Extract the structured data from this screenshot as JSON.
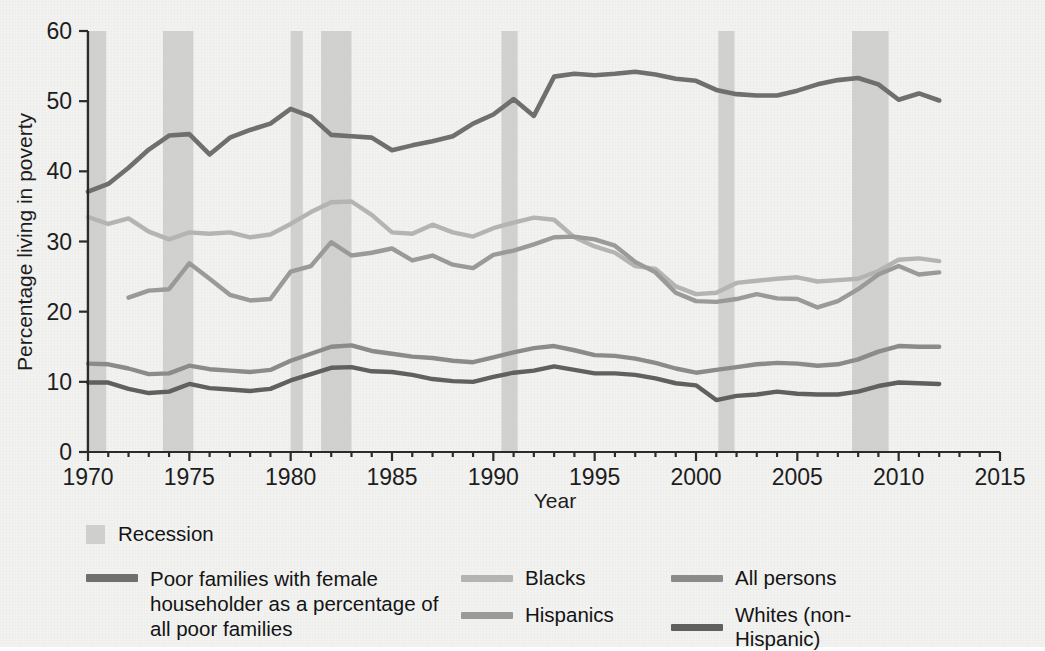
{
  "chart_data": {
    "type": "line",
    "title": "",
    "xlabel": "Year",
    "ylabel": "Percentage living in poverty",
    "xlim": [
      1970,
      2015
    ],
    "ylim": [
      0,
      60
    ],
    "xticks": [
      1970,
      1975,
      1980,
      1985,
      1990,
      1995,
      2000,
      2005,
      2010,
      2015
    ],
    "yticks": [
      0,
      10,
      20,
      30,
      40,
      50,
      60
    ],
    "grid": false,
    "legend_position": "below-plot",
    "recession_label": "Recession",
    "recessions": [
      {
        "start": 1969.9,
        "end": 1970.9
      },
      {
        "start": 1973.7,
        "end": 1975.2
      },
      {
        "start": 1980.0,
        "end": 1980.6
      },
      {
        "start": 1981.5,
        "end": 1983.0
      },
      {
        "start": 1990.4,
        "end": 1991.2
      },
      {
        "start": 2001.1,
        "end": 2001.9
      },
      {
        "start": 2007.7,
        "end": 2009.5
      }
    ],
    "series": [
      {
        "name": "Poor families with female householder as a percentage of all poor families",
        "color": "#6f6f6f",
        "width": 4.6,
        "x": [
          1970,
          1971,
          1972,
          1973,
          1974,
          1975,
          1976,
          1977,
          1978,
          1979,
          1980,
          1981,
          1982,
          1983,
          1984,
          1985,
          1986,
          1987,
          1988,
          1989,
          1990,
          1991,
          1992,
          1993,
          1994,
          1995,
          1996,
          1997,
          1998,
          1999,
          2000,
          2001,
          2002,
          2003,
          2004,
          2005,
          2006,
          2007,
          2008,
          2009,
          2010,
          2011,
          2012
        ],
        "values": [
          37.1,
          38.2,
          40.5,
          43.1,
          45.1,
          45.3,
          42.4,
          44.8,
          45.9,
          46.8,
          48.9,
          47.8,
          45.2,
          45.0,
          44.8,
          43.0,
          43.7,
          44.3,
          45.0,
          46.8,
          48.1,
          50.3,
          47.9,
          53.5,
          53.9,
          53.7,
          53.9,
          54.2,
          53.8,
          53.2,
          52.9,
          51.6,
          51.0,
          50.8,
          50.8,
          51.5,
          52.4,
          53.0,
          53.3,
          52.4,
          50.2,
          51.1,
          50.1
        ]
      },
      {
        "name": "Blacks",
        "color": "#b4b4b2",
        "width": 4.4,
        "x": [
          1970,
          1971,
          1972,
          1973,
          1974,
          1975,
          1976,
          1977,
          1978,
          1979,
          1980,
          1981,
          1982,
          1983,
          1984,
          1985,
          1986,
          1987,
          1988,
          1989,
          1990,
          1991,
          1992,
          1993,
          1994,
          1995,
          1996,
          1997,
          1998,
          1999,
          2000,
          2001,
          2002,
          2003,
          2004,
          2005,
          2006,
          2007,
          2008,
          2009,
          2010,
          2011,
          2012
        ],
        "values": [
          33.5,
          32.5,
          33.3,
          31.4,
          30.3,
          31.3,
          31.1,
          31.3,
          30.6,
          31.0,
          32.5,
          34.2,
          35.6,
          35.7,
          33.8,
          31.3,
          31.1,
          32.4,
          31.3,
          30.7,
          31.9,
          32.7,
          33.4,
          33.1,
          30.6,
          29.3,
          28.4,
          26.5,
          26.1,
          23.6,
          22.5,
          22.7,
          24.1,
          24.4,
          24.7,
          24.9,
          24.3,
          24.5,
          24.7,
          25.8,
          27.4,
          27.6,
          27.2
        ]
      },
      {
        "name": "Hispanics",
        "color": "#9a9a98",
        "width": 4.4,
        "x": [
          1972,
          1973,
          1974,
          1975,
          1976,
          1977,
          1978,
          1979,
          1980,
          1981,
          1982,
          1983,
          1984,
          1985,
          1986,
          1987,
          1988,
          1989,
          1990,
          1991,
          1992,
          1993,
          1994,
          1995,
          1996,
          1997,
          1998,
          1999,
          2000,
          2001,
          2002,
          2003,
          2004,
          2005,
          2006,
          2007,
          2008,
          2009,
          2010,
          2011,
          2012
        ],
        "values": [
          22.0,
          23.0,
          23.2,
          26.9,
          24.7,
          22.4,
          21.6,
          21.8,
          25.7,
          26.5,
          29.9,
          28.0,
          28.4,
          29.0,
          27.3,
          28.0,
          26.7,
          26.2,
          28.1,
          28.7,
          29.6,
          30.6,
          30.7,
          30.3,
          29.4,
          27.1,
          25.6,
          22.7,
          21.5,
          21.4,
          21.8,
          22.5,
          21.9,
          21.8,
          20.6,
          21.5,
          23.2,
          25.3,
          26.5,
          25.3,
          25.6
        ]
      },
      {
        "name": "All persons",
        "color": "#8b8b89",
        "width": 4.4,
        "x": [
          1970,
          1971,
          1972,
          1973,
          1974,
          1975,
          1976,
          1977,
          1978,
          1979,
          1980,
          1981,
          1982,
          1983,
          1984,
          1985,
          1986,
          1987,
          1988,
          1989,
          1990,
          1991,
          1992,
          1993,
          1994,
          1995,
          1996,
          1997,
          1998,
          1999,
          2000,
          2001,
          2002,
          2003,
          2004,
          2005,
          2006,
          2007,
          2008,
          2009,
          2010,
          2011,
          2012
        ],
        "values": [
          12.6,
          12.5,
          11.9,
          11.1,
          11.2,
          12.3,
          11.8,
          11.6,
          11.4,
          11.7,
          13.0,
          14.0,
          15.0,
          15.2,
          14.4,
          14.0,
          13.6,
          13.4,
          13.0,
          12.8,
          13.5,
          14.2,
          14.8,
          15.1,
          14.5,
          13.8,
          13.7,
          13.3,
          12.7,
          11.9,
          11.3,
          11.7,
          12.1,
          12.5,
          12.7,
          12.6,
          12.3,
          12.5,
          13.2,
          14.3,
          15.1,
          15.0,
          15.0
        ]
      },
      {
        "name": "Whites (non-Hispanic)",
        "color": "#606060",
        "width": 4.4,
        "x": [
          1970,
          1971,
          1972,
          1973,
          1974,
          1975,
          1976,
          1977,
          1978,
          1979,
          1980,
          1981,
          1982,
          1983,
          1984,
          1985,
          1986,
          1987,
          1988,
          1989,
          1990,
          1991,
          1992,
          1993,
          1994,
          1995,
          1996,
          1997,
          1998,
          1999,
          2000,
          2001,
          2002,
          2003,
          2004,
          2005,
          2006,
          2007,
          2008,
          2009,
          2010,
          2011,
          2012
        ],
        "values": [
          9.9,
          9.9,
          9.0,
          8.4,
          8.6,
          9.7,
          9.1,
          8.9,
          8.7,
          9.0,
          10.2,
          11.1,
          12.0,
          12.1,
          11.5,
          11.4,
          11.0,
          10.4,
          10.1,
          10.0,
          10.7,
          11.3,
          11.6,
          12.2,
          11.7,
          11.2,
          11.2,
          11.0,
          10.5,
          9.8,
          9.5,
          7.4,
          8.0,
          8.2,
          8.6,
          8.3,
          8.2,
          8.2,
          8.6,
          9.4,
          9.9,
          9.8,
          9.7
        ]
      }
    ]
  },
  "axis": {
    "y_title": "Percentage living in poverty",
    "x_title": "Year",
    "y_labels": [
      "60",
      "50",
      "40",
      "30",
      "20",
      "10",
      "0"
    ],
    "x_labels": [
      "1970",
      "1975",
      "1980",
      "1985",
      "1990",
      "1995",
      "2000",
      "2005",
      "2010",
      "2015"
    ]
  },
  "legend": {
    "recession": {
      "label": "Recession",
      "color": "#cfcfcd"
    },
    "items": [
      {
        "label": "Poor families with female\nhouseholder as a percentage\nof all poor families",
        "color": "#6f6f6f"
      },
      {
        "label": "Blacks",
        "color": "#b4b4b2"
      },
      {
        "label": "Hispanics",
        "color": "#9a9a98"
      },
      {
        "label": "All persons",
        "color": "#8b8b89"
      },
      {
        "label": "Whites (non-Hispanic)",
        "color": "#606060"
      }
    ]
  },
  "colors": {
    "background": "#f2f2f1",
    "axis": "#2b2b2b",
    "recession_band": "#c9c9c7"
  }
}
